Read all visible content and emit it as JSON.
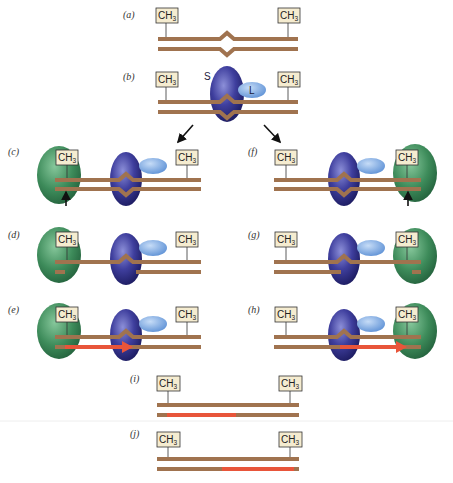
{
  "figure": {
    "methyl_label": "CH",
    "methyl_subscript": "3",
    "protein_labels": {
      "S": "S",
      "L": "L"
    },
    "colors": {
      "dna": "#a0734f",
      "new_dna": "#e8553a",
      "mut_s": "#3b3a8f",
      "mut_l": "#7ea9e0",
      "mut_h": "#3d8b5a",
      "methyl_box": "#f5ecd0"
    },
    "panels": [
      {
        "id": "a",
        "label": "(a)"
      },
      {
        "id": "b",
        "label": "(b)"
      },
      {
        "id": "c",
        "label": "(c)"
      },
      {
        "id": "d",
        "label": "(d)"
      },
      {
        "id": "e",
        "label": "(e)"
      },
      {
        "id": "f",
        "label": "(f)"
      },
      {
        "id": "g",
        "label": "(g)"
      },
      {
        "id": "h",
        "label": "(h)"
      },
      {
        "id": "i",
        "label": "(i)"
      },
      {
        "id": "j",
        "label": "(j)"
      }
    ]
  }
}
